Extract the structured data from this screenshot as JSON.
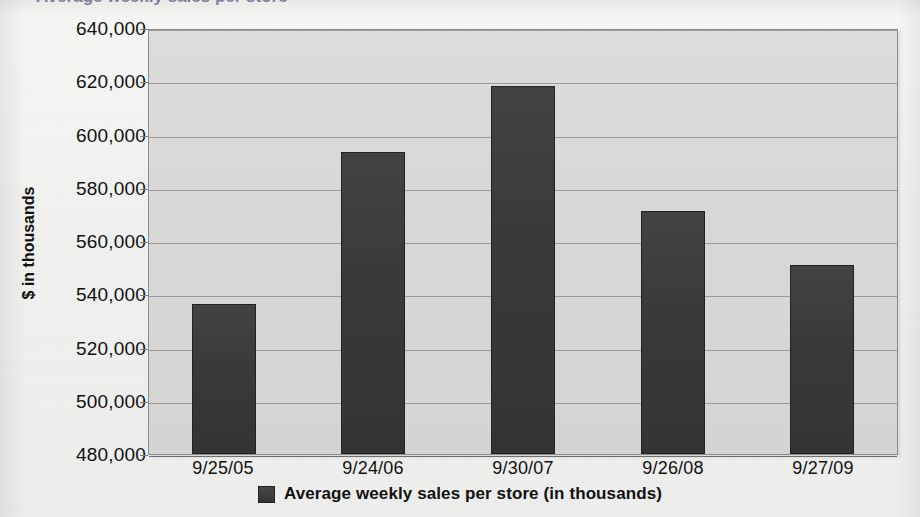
{
  "page": {
    "cropped_title_fragment": "Average weekly sales per store"
  },
  "chart_data": {
    "type": "bar",
    "title": "",
    "categories": [
      "9/25/05",
      "9/24/06",
      "9/30/07",
      "9/26/08",
      "9/27/09"
    ],
    "values": [
      536500,
      593500,
      618400,
      571300,
      551000
    ],
    "series": [
      {
        "name": "Average weekly sales per store (in thousands)",
        "values": [
          536500,
          593500,
          618400,
          571300,
          551000
        ]
      }
    ],
    "xlabel": "",
    "ylabel": "$ in thousands",
    "ylim": [
      480000,
      640000
    ],
    "ytick_step": 20000,
    "ytick_labels": [
      "640,000",
      "620,000",
      "600,000",
      "580,000",
      "560,000",
      "540,000",
      "520,000",
      "500,000",
      "480,000"
    ],
    "ytick_values": [
      640000,
      620000,
      600000,
      580000,
      560000,
      540000,
      520000,
      500000,
      480000
    ],
    "grid": true,
    "legend_position": "bottom",
    "legend_entries": [
      "Average weekly sales per store (in thousands)"
    ],
    "colors": {
      "bar": "#3a3a3a",
      "plot_background": "#d7d7d5",
      "gridline": "#9a9a9a",
      "page_background": "#f3f3f1",
      "text": "#111111"
    }
  }
}
